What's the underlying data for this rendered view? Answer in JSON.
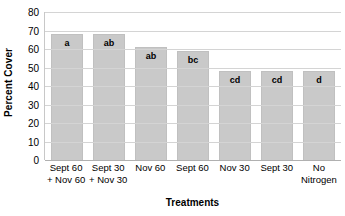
{
  "chart_data": {
    "type": "bar",
    "title": "",
    "xlabel": "Treatments",
    "ylabel": "Percent Cover",
    "ylim": [
      0,
      80
    ],
    "yticks": [
      80,
      70,
      60,
      50,
      40,
      30,
      20,
      10,
      0
    ],
    "grid": true,
    "legend": "none",
    "categories": [
      "Sept 60 + Nov 60",
      "Sept 30 + Nov 30",
      "Nov 60",
      "Sept 60",
      "Nov 30",
      "Sept 30",
      "No Nitrogen"
    ],
    "category_lines": [
      [
        "Sept 60",
        "+ Nov 60"
      ],
      [
        "Sept 30",
        "+ Nov 30"
      ],
      [
        "Nov 60",
        ""
      ],
      [
        "Sept 60",
        ""
      ],
      [
        "Nov 30",
        ""
      ],
      [
        "Sept 30",
        ""
      ],
      [
        "No",
        "Nitrogen"
      ]
    ],
    "values": [
      68,
      68,
      61,
      59,
      48,
      48,
      48
    ],
    "annotations": [
      "a",
      "ab",
      "ab",
      "bc",
      "cd",
      "cd",
      "d"
    ],
    "bar_color": "#c9c9c9",
    "grid_color": "#d4d4d4"
  }
}
